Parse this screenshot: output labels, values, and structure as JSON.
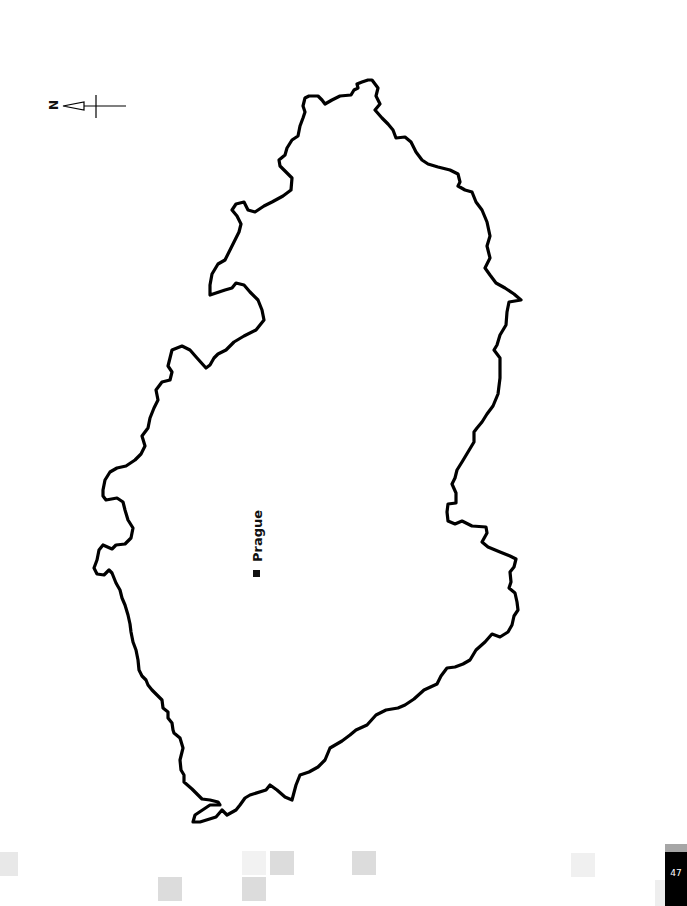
{
  "map": {
    "title": "",
    "compass": {
      "label": "N",
      "direction": "left"
    },
    "region_outline": "country boundary outline (Czech Republic, rotated)",
    "cities": [
      {
        "name": "Prague",
        "marker": "filled-square"
      }
    ],
    "colors": {
      "outline": "#000000",
      "background": "#ffffff"
    }
  },
  "footer": {
    "page_number": "47",
    "page_tab_color": "#000000",
    "decor_squares_color": "#dcdcdc"
  }
}
